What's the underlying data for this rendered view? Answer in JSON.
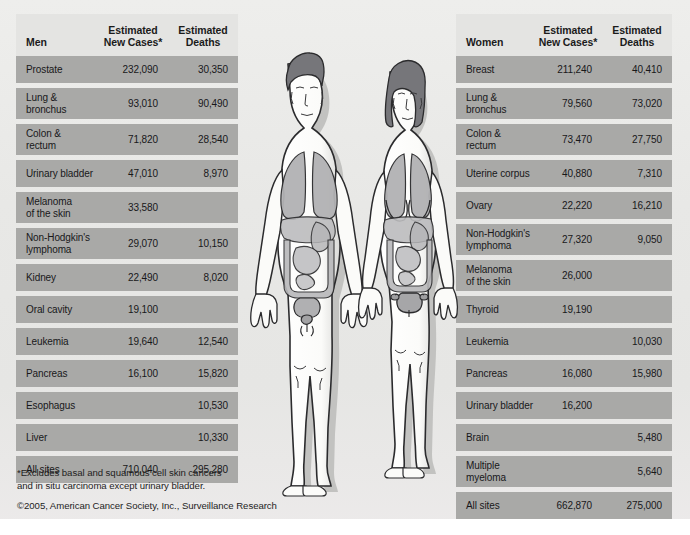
{
  "poster": {
    "background_color": "#e9e9e7",
    "row_color": "#a9a9a7",
    "header_color": "#e4e4e2"
  },
  "men_table": {
    "sex_label": "Men",
    "col_cases": "Estimated\nNew Cases*",
    "col_cases_line1": "Estimated",
    "col_cases_line2": "New Cases*",
    "col_deaths_line1": "Estimated",
    "col_deaths_line2": "Deaths",
    "rows": [
      {
        "site": "Prostate",
        "site2": "",
        "cases": "232,090",
        "deaths": "30,350"
      },
      {
        "site": "Lung &",
        "site2": "bronchus",
        "cases": "93,010",
        "deaths": "90,490"
      },
      {
        "site": "Colon &",
        "site2": "rectum",
        "cases": "71,820",
        "deaths": "28,540"
      },
      {
        "site": "Urinary bladder",
        "site2": "",
        "cases": "47,010",
        "deaths": "8,970"
      },
      {
        "site": "Melanoma",
        "site2": "of the skin",
        "cases": "33,580",
        "deaths": ""
      },
      {
        "site": "Non-Hodgkin's",
        "site2": "lymphoma",
        "cases": "29,070",
        "deaths": "10,150"
      },
      {
        "site": "Kidney",
        "site2": "",
        "cases": "22,490",
        "deaths": "8,020"
      },
      {
        "site": "Oral cavity",
        "site2": "",
        "cases": "19,100",
        "deaths": ""
      },
      {
        "site": "Leukemia",
        "site2": "",
        "cases": "19,640",
        "deaths": "12,540"
      },
      {
        "site": "Pancreas",
        "site2": "",
        "cases": "16,100",
        "deaths": "15,820"
      },
      {
        "site": "Esophagus",
        "site2": "",
        "cases": "",
        "deaths": "10,530"
      },
      {
        "site": "Liver",
        "site2": "",
        "cases": "",
        "deaths": "10,330"
      },
      {
        "site": "All sites",
        "site2": "",
        "cases": "710,040",
        "deaths": "295,280"
      }
    ]
  },
  "women_table": {
    "sex_label": "Women",
    "col_cases_line1": "Estimated",
    "col_cases_line2": "New Cases*",
    "col_deaths_line1": "Estimated",
    "col_deaths_line2": "Deaths",
    "rows": [
      {
        "site": "Breast",
        "site2": "",
        "cases": "211,240",
        "deaths": "40,410"
      },
      {
        "site": "Lung &",
        "site2": "bronchus",
        "cases": "79,560",
        "deaths": "73,020"
      },
      {
        "site": "Colon &",
        "site2": "rectum",
        "cases": "73,470",
        "deaths": "27,750"
      },
      {
        "site": "Uterine corpus",
        "site2": "",
        "cases": "40,880",
        "deaths": "7,310"
      },
      {
        "site": "Ovary",
        "site2": "",
        "cases": "22,220",
        "deaths": "16,210"
      },
      {
        "site": "Non-Hodgkin's",
        "site2": "lymphoma",
        "cases": "27,320",
        "deaths": "9,050"
      },
      {
        "site": "Melanoma",
        "site2": "of the skin",
        "cases": "26,000",
        "deaths": ""
      },
      {
        "site": "Thyroid",
        "site2": "",
        "cases": "19,190",
        "deaths": ""
      },
      {
        "site": "Leukemia",
        "site2": "",
        "cases": "",
        "deaths": "10,030"
      },
      {
        "site": "Pancreas",
        "site2": "",
        "cases": "16,080",
        "deaths": "15,980"
      },
      {
        "site": "Urinary bladder",
        "site2": "",
        "cases": "16,200",
        "deaths": ""
      },
      {
        "site": "Brain",
        "site2": "",
        "cases": "",
        "deaths": "5,480"
      },
      {
        "site": "Multiple",
        "site2": "myeloma",
        "cases": "",
        "deaths": "5,640"
      },
      {
        "site": "All sites",
        "site2": "",
        "cases": "662,870",
        "deaths": "275,000"
      }
    ]
  },
  "footnote": {
    "line1": "*Excludes basal and squamous cell skin cancers",
    "line2": "and in situ carcinoma except urinary bladder.",
    "copyright": "©2005, American Cancer Society, Inc., Surveillance Research"
  },
  "figures": {
    "male_label": "male-anatomy-figure",
    "female_label": "female-anatomy-figure",
    "skin_color": "#fdfdfb",
    "organ_color": "#b4b4b6",
    "hair_color": "#7b7b7d",
    "outline_color": "#2b2b2d"
  }
}
